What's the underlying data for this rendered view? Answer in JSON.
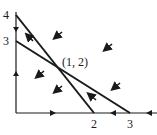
{
  "diagram": {
    "type": "phase-plane",
    "axes": {
      "x_ticks": [
        {
          "value": 2,
          "label": "2"
        },
        {
          "value": 3,
          "label": "3"
        }
      ],
      "y_ticks": [
        {
          "value": 4,
          "label": "4"
        },
        {
          "value": 3,
          "label": "3"
        }
      ]
    },
    "lines": [
      {
        "name": "steep-nullcline",
        "from": [
          0,
          4
        ],
        "to": [
          2,
          0
        ]
      },
      {
        "name": "shallow-nullcline",
        "from": [
          0,
          3
        ],
        "to": [
          3,
          0
        ]
      }
    ],
    "equilibrium": {
      "label": "(1, 2)",
      "x": 1,
      "y": 2
    },
    "colors": {
      "ink": "#1a1a1a",
      "background": "#ffffff"
    }
  }
}
